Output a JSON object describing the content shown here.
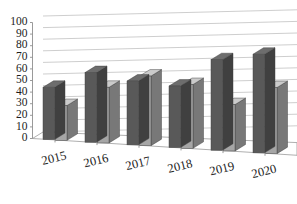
{
  "chart_data": {
    "type": "bar",
    "title": "",
    "subtitle": "",
    "xlabel": "",
    "ylabel": "",
    "categories": [
      "2015",
      "2016",
      "2017",
      "2018",
      "2019",
      "2020"
    ],
    "series": [
      {
        "name": "Series 1",
        "color": "#595959",
        "values": [
          45,
          60,
          55,
          53,
          78,
          85
        ]
      },
      {
        "name": "Series 2",
        "color": "#a6a6a6",
        "values": [
          30,
          48,
          60,
          55,
          40,
          57
        ]
      }
    ],
    "ylim": [
      0,
      100
    ],
    "ytick_step": 10,
    "ytick_labels": [
      "100",
      "90",
      "80",
      "70",
      "60",
      "50",
      "40",
      "30",
      "20",
      "10",
      "0"
    ],
    "grid": true,
    "grid_axis": "y",
    "legend": false,
    "legend_position": "none",
    "style": "3d-column",
    "background_color": "#ffffff",
    "gridline_color": "#b9b9b9",
    "axis_color": "#8f8f8f",
    "tick_label_color": "#1d1d1d",
    "xtick_rotation_deg": -14
  }
}
